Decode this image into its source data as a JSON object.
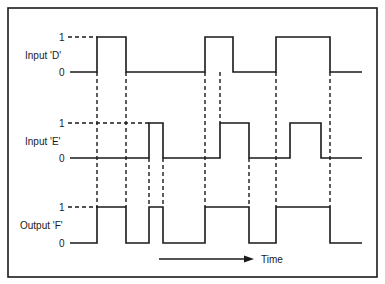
{
  "diagram": {
    "type": "timing-diagram",
    "colors": {
      "ink": "#1a1a1a",
      "background": "#ffffff"
    },
    "signals": [
      {
        "name": "Input 'D'",
        "high_label": "1",
        "low_label": "0",
        "levels": [
          0,
          1,
          0,
          1,
          0,
          1,
          0
        ],
        "edges_x": [
          97,
          126,
          205,
          233,
          276,
          330
        ]
      },
      {
        "name": "Input 'E'",
        "high_label": "1",
        "low_label": "0",
        "levels": [
          0,
          1,
          0,
          1,
          0,
          1,
          0
        ],
        "edges_x": [
          149,
          163,
          220,
          249,
          290,
          321
        ]
      },
      {
        "name": "Output 'F'",
        "high_label": "1",
        "low_label": "0",
        "levels": [
          0,
          1,
          0,
          1,
          0,
          1,
          0,
          1,
          0
        ],
        "edges_x": [
          97,
          126,
          149,
          163,
          205,
          249,
          276,
          330
        ]
      }
    ],
    "time_axis": {
      "label": "Time",
      "direction": "right"
    }
  }
}
